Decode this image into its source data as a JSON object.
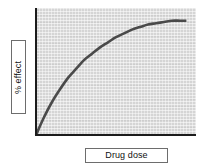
{
  "chart_data": {
    "type": "line",
    "title": "",
    "subtitle": "",
    "xlabel": "Drug dose",
    "ylabel": "% effect",
    "grid": false,
    "legend": null,
    "axis_ticks": {
      "x": [],
      "y": []
    },
    "xlim": [
      0,
      100
    ],
    "ylim": [
      0,
      100
    ],
    "series": [
      {
        "name": "dose-response",
        "description": "hyperbolic dose-response curve rising steeply then plateauing",
        "x": [
          0,
          5,
          10,
          15,
          20,
          25,
          30,
          35,
          40,
          45,
          50,
          55,
          60,
          65,
          70,
          75,
          80,
          85,
          90,
          94
        ],
        "y": [
          0,
          14,
          26,
          36,
          45,
          52,
          59,
          64,
          69,
          73,
          77,
          80,
          83,
          85,
          87,
          88,
          89,
          90,
          90,
          90
        ]
      }
    ],
    "colors": {
      "curve": "#4a4a4a",
      "plot_background": "#d5d5d5",
      "axis": "#1c1c1c",
      "label_box_background": "#ffffff",
      "label_box_border": "#6d6d6d",
      "figure_background": "#ffffff"
    }
  },
  "axis_labels": {
    "y": "% effect",
    "x": "Drug dose"
  }
}
